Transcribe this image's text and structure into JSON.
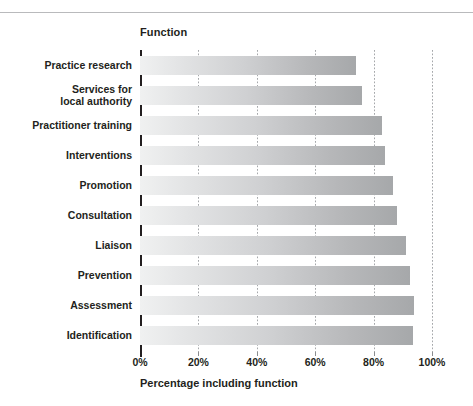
{
  "figure": {
    "axis_title": "Function",
    "x_axis_label": "Percentage including function",
    "accent_color": "#231f20",
    "bar_gradient_start": "#f0f1f1",
    "bar_gradient_end": "#a6a8aa",
    "gridline_color": "#a6a8ab"
  },
  "chart_data": {
    "type": "bar",
    "orientation": "horizontal",
    "title": "Function",
    "xlabel": "Percentage including function",
    "ylabel": "Function",
    "xlim": [
      0,
      100
    ],
    "grid": true,
    "legend": false,
    "categories": [
      "Practice research",
      "Services for\nlocal authority",
      "Practitioner training",
      "Interventions",
      "Promotion",
      "Consultation",
      "Liaison",
      "Prevention",
      "Assessment",
      "Identification"
    ],
    "values": [
      74,
      76,
      83,
      84,
      86.5,
      88,
      91,
      92.5,
      94,
      93.5
    ],
    "xticks": [
      "0%",
      "20%",
      "40%",
      "60%",
      "80%",
      "100%"
    ],
    "xtick_values": [
      0,
      20,
      40,
      60,
      80,
      100
    ]
  }
}
